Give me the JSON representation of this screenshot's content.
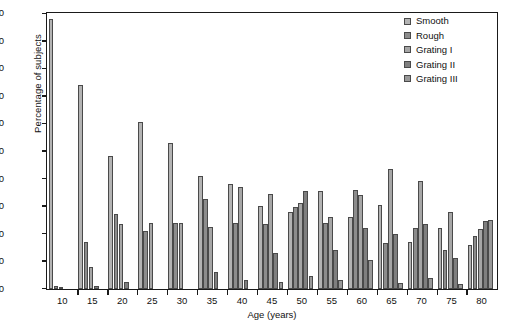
{
  "chart_data": {
    "type": "bar",
    "title": "",
    "xlabel": "Age (years)",
    "ylabel": "Percentage of subjects",
    "ylim": [
      0,
      100
    ],
    "ytick_labels": [
      "0",
      "10",
      "20",
      "30",
      "40",
      "50",
      "60",
      "70",
      "80",
      "90",
      "100"
    ],
    "xtick_labels": [
      "10",
      "15",
      "20",
      "25",
      "30",
      "35",
      "40",
      "45",
      "50",
      "55",
      "60",
      "65",
      "70",
      "75",
      "80"
    ],
    "grid": false,
    "legend_position": "top-right",
    "categories": [
      "5-9",
      "10-14",
      "15-19",
      "20-24",
      "25-29",
      "30-34",
      "35-39",
      "40-44",
      "45-49",
      "50-54",
      "55-59",
      "60-64",
      "65-69",
      "70-74",
      "75-80"
    ],
    "series": [
      {
        "name": "Smooth",
        "color": "#b3b3b3",
        "values": [
          98,
          74,
          48,
          60.5,
          53,
          41,
          38,
          30,
          28,
          35.5,
          26,
          30.5,
          17,
          22,
          16
        ]
      },
      {
        "name": "Rough",
        "color": "#8c8c8c",
        "values": [
          1,
          17,
          27,
          21,
          24,
          32.5,
          24,
          23.5,
          29.5,
          24,
          36,
          16.5,
          22,
          14,
          19
        ]
      },
      {
        "name": "Grating I",
        "color": "#a6a6a6",
        "values": [
          0.5,
          8,
          23.5,
          24,
          24,
          22.5,
          37,
          34.5,
          31,
          26,
          34,
          43.5,
          39,
          28,
          21.5
        ]
      },
      {
        "name": "Grating II",
        "color": "#7f7f7f",
        "values": [
          0,
          1,
          2.5,
          0,
          0,
          6,
          3,
          13,
          35.5,
          14,
          22,
          20,
          23.5,
          11,
          24.5
        ]
      },
      {
        "name": "Grating III",
        "color": "#999999",
        "values": [
          0,
          0,
          0,
          0,
          0,
          0,
          0,
          2.5,
          4.5,
          3,
          10.5,
          2,
          4,
          1.5,
          25
        ]
      }
    ]
  },
  "legend": {
    "items": [
      {
        "label": "Smooth"
      },
      {
        "label": "Rough"
      },
      {
        "label": "Grating I"
      },
      {
        "label": "Grating II"
      },
      {
        "label": "Grating III"
      }
    ]
  },
  "axes": {
    "y_title": "Percentage of subjects",
    "x_title": "Age (years)"
  }
}
